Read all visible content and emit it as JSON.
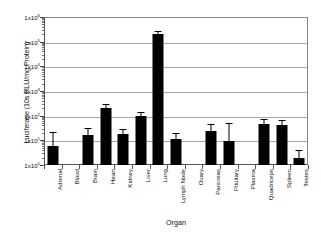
{
  "chart_data": {
    "type": "bar",
    "title": "",
    "xlabel": "Organ",
    "ylabel": "Luciferase (10s RLU/mg Protein)",
    "yscale": "log",
    "ylim": [
      1,
      1000000
    ],
    "ytick_labels": [
      "1x10",
      "1x10",
      "1x10",
      "1x10",
      "1x10",
      "1x10",
      "1x10"
    ],
    "ytick_exponents": [
      "0",
      "1",
      "2",
      "3",
      "4",
      "5",
      "6"
    ],
    "ytick_values": [
      1,
      10,
      100,
      1000,
      10000,
      100000,
      1000000
    ],
    "grid": true,
    "legend": "none",
    "categories": [
      "Adrenal",
      "Blood",
      "Brain",
      "Heart",
      "Kidney",
      "Liver",
      "Lung",
      "Lymph Node",
      "Ovary",
      "Pancreas",
      "Pituitary",
      "Plasma",
      "Quadriceps",
      "Spleen",
      "Testes"
    ],
    "values": [
      6.0,
      1.0,
      17.0,
      210.0,
      18.0,
      95.0,
      200000.0,
      11.0,
      1.0,
      23.0,
      9.0,
      1.0,
      45.0,
      43.0,
      2.0
    ],
    "error_high": [
      22.0,
      1.0,
      32.0,
      300.0,
      28.0,
      140.0,
      260000.0,
      20.0,
      1.0,
      44.0,
      52.0,
      1.0,
      70.0,
      66.0,
      4.2
    ],
    "series": [
      {
        "name": "Luciferase activity",
        "values": [
          6.0,
          1.0,
          17.0,
          210.0,
          18.0,
          95.0,
          200000.0,
          11.0,
          1.0,
          23.0,
          9.0,
          1.0,
          45.0,
          43.0,
          2.0
        ]
      }
    ],
    "bar_color": "#000000",
    "grid_color": "#a8a8a8"
  }
}
